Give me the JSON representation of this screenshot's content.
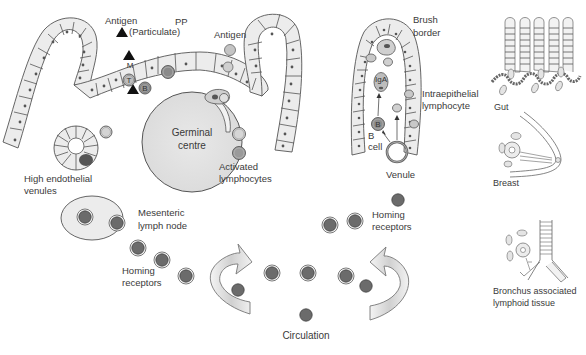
{
  "diagram": {
    "type": "biomedical-schematic",
    "colors": {
      "background": "#ffffff",
      "epithelium_fill": "#ececec",
      "outline": "#555555",
      "lymphocyte_dark": "#6b6b6b",
      "lymphocyte_light": "#c8c8c8",
      "germinal_centre_fill": "#e4e4e4",
      "antigen_triangle": "#111111",
      "text": "#3a3a3a"
    }
  },
  "labels": {
    "antigen_particulate_1": "Antigen",
    "antigen_particulate_2": "(Particulate)",
    "pp": "PP",
    "antigen": "Antigen",
    "m_cell": "M",
    "t_cell": "T",
    "b_cell_pp": "B",
    "germinal_centre_1": "Germinal",
    "germinal_centre_2": "centre",
    "activated_lymphocytes_1": "Activated",
    "activated_lymphocytes_2": "lymphocytes",
    "high_endothelial_1": "High endothelial",
    "high_endothelial_2": "venules",
    "mesenteric_1": "Mesenteric",
    "mesenteric_2": "lymph node",
    "homing_left_1": "Homing",
    "homing_left_2": "receptors",
    "homing_right_1": "Homing",
    "homing_right_2": "receptors",
    "circulation": "Circulation",
    "brush_border_1": "Brush",
    "brush_border_2": "border",
    "iga": "IgA",
    "intraepithelial_1": "Intraepithelial",
    "intraepithelial_2": "lymphocyte",
    "b_cell_villus": "B",
    "b_cell_label_1": "B",
    "b_cell_label_2": "cell",
    "venule": "Venule",
    "gut": "Gut",
    "breast": "Breast",
    "balt_1": "Bronchus associated",
    "balt_2": "lymphoid tissue"
  }
}
